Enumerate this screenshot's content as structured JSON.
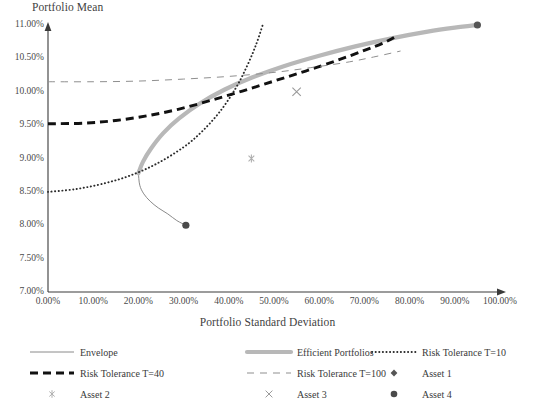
{
  "chart_data": {
    "type": "line",
    "title": "",
    "xlabel": "Portfolio Standard Deviation",
    "ylabel": "Portfolio Mean",
    "xlim": [
      0,
      100
    ],
    "ylim": [
      7,
      11
    ],
    "x_unit": "%",
    "y_unit": "%",
    "grid": false,
    "x_ticks": [
      "0.00%",
      "10.00%",
      "20.00%",
      "30.00%",
      "40.00%",
      "50.00%",
      "60.00%",
      "70.00%",
      "80.00%",
      "90.00%",
      "100.00%"
    ],
    "y_ticks": [
      "7.00%",
      "7.50%",
      "8.00%",
      "8.50%",
      "9.00%",
      "9.50%",
      "10.00%",
      "10.50%",
      "11.00%"
    ],
    "legend_position": "bottom",
    "series": [
      {
        "name": "Envelope",
        "style": "solid-thin",
        "color": "#8a8a8a",
        "points": [
          [
            20.0,
            8.78
          ],
          [
            20.3,
            8.6
          ],
          [
            21.2,
            8.47
          ],
          [
            22.6,
            8.36
          ],
          [
            24.4,
            8.26
          ],
          [
            26.5,
            8.17
          ],
          [
            28.5,
            8.07
          ],
          [
            30.5,
            8.0
          ]
        ]
      },
      {
        "name": "Efficient Portfolios",
        "style": "solid-thick",
        "color": "#b8b8b8",
        "points": [
          [
            20.0,
            8.78
          ],
          [
            21.0,
            8.95
          ],
          [
            22.8,
            9.15
          ],
          [
            25.5,
            9.38
          ],
          [
            29.0,
            9.6
          ],
          [
            33.5,
            9.82
          ],
          [
            39.0,
            10.03
          ],
          [
            45.0,
            10.21
          ],
          [
            52.0,
            10.38
          ],
          [
            60.0,
            10.54
          ],
          [
            68.0,
            10.68
          ],
          [
            76.0,
            10.8
          ],
          [
            84.0,
            10.9
          ],
          [
            90.0,
            10.96
          ],
          [
            95.0,
            11.0
          ]
        ]
      },
      {
        "name": "Risk Tolerance T=10",
        "style": "dotted",
        "color": "#2b2b2b",
        "points": [
          [
            0.0,
            8.5
          ],
          [
            6.0,
            8.54
          ],
          [
            12.0,
            8.62
          ],
          [
            18.0,
            8.74
          ],
          [
            24.0,
            8.92
          ],
          [
            30.0,
            9.17
          ],
          [
            34.0,
            9.4
          ],
          [
            38.0,
            9.7
          ],
          [
            41.5,
            10.05
          ],
          [
            44.0,
            10.38
          ],
          [
            46.0,
            10.7
          ],
          [
            47.5,
            11.0
          ]
        ]
      },
      {
        "name": "Risk Tolerance T=40",
        "style": "dashed-bold",
        "color": "#111111",
        "points": [
          [
            0.0,
            9.52
          ],
          [
            8.0,
            9.53
          ],
          [
            15.0,
            9.57
          ],
          [
            22.0,
            9.64
          ],
          [
            29.0,
            9.74
          ],
          [
            36.0,
            9.87
          ],
          [
            43.0,
            10.01
          ],
          [
            50.0,
            10.16
          ],
          [
            57.0,
            10.31
          ],
          [
            64.0,
            10.47
          ],
          [
            70.0,
            10.62
          ],
          [
            74.5,
            10.74
          ],
          [
            77.5,
            10.85
          ]
        ]
      },
      {
        "name": "Risk Tolerance T=100",
        "style": "dashed-thin",
        "color": "#8f8f8f",
        "points": [
          [
            0.0,
            10.15
          ],
          [
            10.0,
            10.15
          ],
          [
            20.0,
            10.16
          ],
          [
            30.0,
            10.19
          ],
          [
            40.0,
            10.23
          ],
          [
            50.0,
            10.29
          ],
          [
            58.0,
            10.36
          ],
          [
            66.0,
            10.44
          ],
          [
            72.0,
            10.52
          ],
          [
            78.0,
            10.61
          ]
        ]
      }
    ],
    "markers": [
      {
        "name": "Asset 1",
        "x": 95.0,
        "y": 11.0,
        "shape": "circle",
        "color": "#555555"
      },
      {
        "name": "Asset 2",
        "x": 45.0,
        "y": 9.0,
        "shape": "asterisk",
        "color": "#b0b0b0"
      },
      {
        "name": "Asset 3",
        "x": 55.0,
        "y": 10.0,
        "shape": "cross",
        "color": "#9a9a9a"
      },
      {
        "name": "Asset 4",
        "x": 30.5,
        "y": 8.0,
        "shape": "circle",
        "color": "#4a4a4a"
      }
    ]
  },
  "axes": {
    "y_title": "Portfolio Mean",
    "x_title": "Portfolio Standard Deviation"
  },
  "legend": {
    "items": [
      {
        "label": "Envelope",
        "key": "line-solid-thin"
      },
      {
        "label": "Efficient Portfolios",
        "key": "line-solid-thick"
      },
      {
        "label": "Risk Tolerance T=10",
        "key": "line-dotted"
      },
      {
        "label": "Risk Tolerance T=40",
        "key": "line-dashed-bold"
      },
      {
        "label": "Risk Tolerance T=100",
        "key": "line-dashed-thin"
      },
      {
        "label": "Asset 1",
        "key": "marker-diamond"
      },
      {
        "label": "Asset 2",
        "key": "marker-asterisk"
      },
      {
        "label": "Asset 3",
        "key": "marker-cross"
      },
      {
        "label": "Asset 4",
        "key": "marker-circle"
      }
    ]
  }
}
